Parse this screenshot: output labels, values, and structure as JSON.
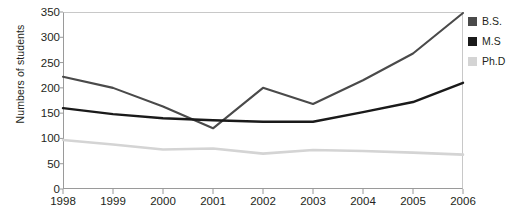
{
  "chart_data": {
    "type": "line",
    "title": "",
    "xlabel": "",
    "ylabel": "Numbers of students",
    "categories": [
      "1998",
      "1999",
      "2000",
      "2001",
      "2002",
      "2003",
      "2004",
      "2005",
      "2006"
    ],
    "ylim": [
      0,
      350
    ],
    "yticks": [
      0,
      50,
      100,
      150,
      200,
      250,
      300,
      350
    ],
    "grid": false,
    "legend_position": "right",
    "series": [
      {
        "name": "B.S.",
        "color": "#4a4a4a",
        "values": [
          222,
          200,
          163,
          120,
          200,
          168,
          215,
          268,
          348
        ]
      },
      {
        "name": "M.S",
        "color": "#1a1a1a",
        "values": [
          160,
          148,
          140,
          136,
          133,
          133,
          152,
          172,
          210
        ]
      },
      {
        "name": "Ph.D",
        "color": "#d4d4d4",
        "values": [
          97,
          88,
          78,
          80,
          70,
          77,
          75,
          72,
          68
        ]
      }
    ]
  },
  "legend": {
    "items": [
      {
        "label": "B.S.",
        "color": "#4a4a4a"
      },
      {
        "label": "M.S",
        "color": "#1a1a1a"
      },
      {
        "label": "Ph.D",
        "color": "#d4d4d4"
      }
    ]
  },
  "axes": {
    "y_title": "Numbers of students",
    "y_tick_labels": [
      "350",
      "300",
      "250",
      "200",
      "150",
      "100",
      "50",
      "0"
    ],
    "x_tick_labels": [
      "1998",
      "1999",
      "2000",
      "2001",
      "2002",
      "2003",
      "2004",
      "2005",
      "2006"
    ]
  }
}
